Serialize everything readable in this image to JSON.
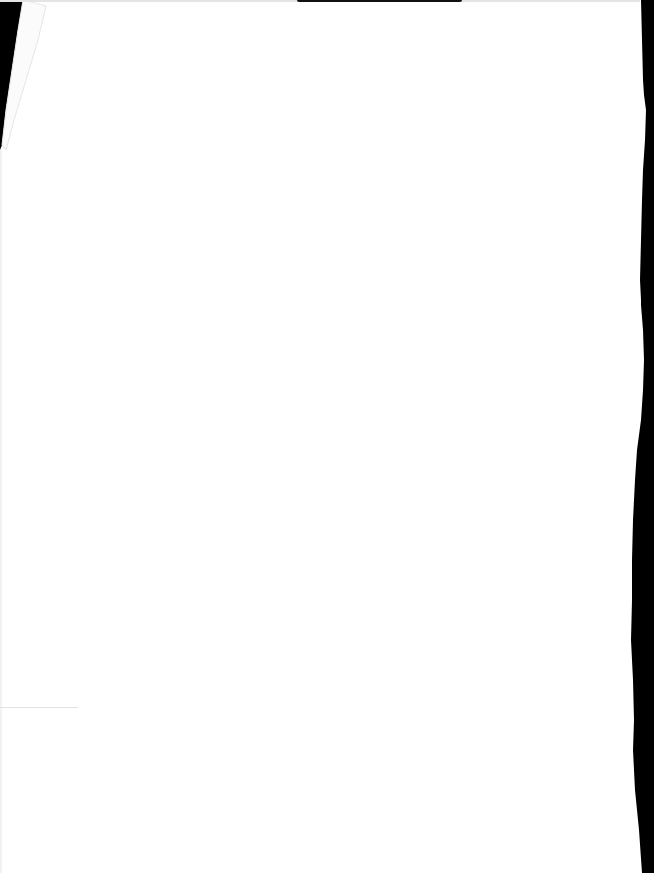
{
  "document": {
    "type": "scanned blank page",
    "text": "",
    "colors": {
      "paper": "#ffffff",
      "scan_background": "#000000",
      "edge_shadow": "#e4e4e4"
    }
  }
}
